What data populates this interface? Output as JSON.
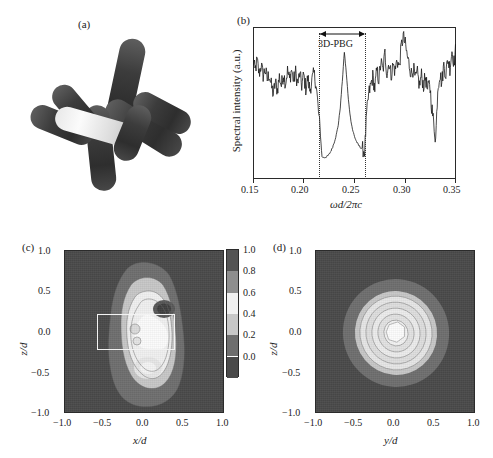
{
  "figure": {
    "panels": [
      {
        "id": "a",
        "label": "(a)",
        "kind": "3d-render",
        "description": "three-dimensional cluster of cylindrical rods"
      },
      {
        "id": "b",
        "label": "(b)",
        "kind": "line"
      },
      {
        "id": "c",
        "label": "(c)",
        "kind": "contour"
      },
      {
        "id": "d",
        "label": "(d)",
        "kind": "contour"
      }
    ]
  },
  "chart_data": [
    {
      "panel": "b",
      "type": "line",
      "title": "",
      "xlabel": "ωd/2πc",
      "ylabel": "Spectral intensity (a.u.)",
      "xlim": [
        0.15,
        0.35
      ],
      "ylim": [
        0,
        1
      ],
      "xticks": [
        0.15,
        0.2,
        0.25,
        0.3,
        0.35
      ],
      "xticklabels": [
        "0.15",
        "0.20",
        "0.25",
        "0.30",
        "0.35"
      ],
      "yticks": [],
      "yticklabels": [],
      "grid": false,
      "legend": null,
      "annotations": [
        {
          "text": "3D-PBG",
          "kind": "arrow-span",
          "x_start": 0.215,
          "x_end": 0.26,
          "y": 0.93
        }
      ],
      "guides": [
        {
          "type": "vline",
          "style": "dotted",
          "x": 0.215
        },
        {
          "type": "vline",
          "style": "dotted",
          "x": 0.26
        }
      ],
      "x": [
        0.15,
        0.152,
        0.154,
        0.156,
        0.158,
        0.16,
        0.162,
        0.164,
        0.166,
        0.168,
        0.17,
        0.172,
        0.174,
        0.176,
        0.178,
        0.18,
        0.182,
        0.184,
        0.186,
        0.188,
        0.19,
        0.192,
        0.194,
        0.196,
        0.198,
        0.2,
        0.202,
        0.204,
        0.206,
        0.208,
        0.21,
        0.212,
        0.214,
        0.216,
        0.218,
        0.22,
        0.222,
        0.224,
        0.226,
        0.228,
        0.23,
        0.232,
        0.234,
        0.236,
        0.238,
        0.24,
        0.242,
        0.244,
        0.246,
        0.248,
        0.25,
        0.252,
        0.254,
        0.256,
        0.258,
        0.26,
        0.262,
        0.264,
        0.266,
        0.268,
        0.27,
        0.272,
        0.274,
        0.276,
        0.278,
        0.28,
        0.282,
        0.284,
        0.286,
        0.288,
        0.29,
        0.292,
        0.294,
        0.296,
        0.298,
        0.3,
        0.302,
        0.304,
        0.306,
        0.308,
        0.31,
        0.312,
        0.314,
        0.316,
        0.318,
        0.32,
        0.322,
        0.324,
        0.326,
        0.328,
        0.33,
        0.332,
        0.334,
        0.336,
        0.338,
        0.34,
        0.342,
        0.344,
        0.346,
        0.348,
        0.35
      ],
      "y": [
        0.8,
        0.72,
        0.79,
        0.7,
        0.76,
        0.69,
        0.73,
        0.66,
        0.7,
        0.62,
        0.56,
        0.64,
        0.59,
        0.68,
        0.62,
        0.7,
        0.64,
        0.72,
        0.66,
        0.73,
        0.65,
        0.71,
        0.63,
        0.7,
        0.62,
        0.69,
        0.6,
        0.67,
        0.59,
        0.65,
        0.7,
        0.64,
        0.48,
        0.32,
        0.13,
        0.125,
        0.13,
        0.14,
        0.16,
        0.19,
        0.23,
        0.28,
        0.35,
        0.47,
        0.65,
        0.85,
        0.7,
        0.52,
        0.4,
        0.32,
        0.27,
        0.235,
        0.21,
        0.195,
        0.185,
        0.17,
        0.42,
        0.56,
        0.62,
        0.68,
        0.6,
        0.72,
        0.66,
        0.78,
        0.72,
        0.84,
        0.7,
        0.78,
        0.69,
        0.76,
        0.72,
        0.8,
        0.74,
        0.88,
        0.96,
        0.9,
        0.82,
        0.76,
        0.7,
        0.74,
        0.66,
        0.7,
        0.62,
        0.69,
        0.62,
        0.68,
        0.58,
        0.64,
        0.48,
        0.36,
        0.25,
        0.6,
        0.7,
        0.64,
        0.76,
        0.7,
        0.8,
        0.74,
        0.86,
        0.78,
        0.88
      ]
    },
    {
      "panel": "c",
      "type": "heatmap",
      "title": "",
      "xlabel": "x/d",
      "ylabel": "z/d",
      "xlim": [
        -1.0,
        1.0
      ],
      "ylim": [
        -1.0,
        1.0
      ],
      "xticks": [
        -1.0,
        -0.5,
        0.0,
        0.5,
        1.0
      ],
      "xticklabels": [
        "−1.0",
        "−0.5",
        "0.0",
        "0.5",
        "1.0"
      ],
      "yticks": [
        -1.0,
        -0.5,
        0.0,
        0.5,
        1.0
      ],
      "yticklabels": [
        "−1.0",
        "−0.5",
        "0.0",
        "0.5",
        "1.0"
      ],
      "grid": false,
      "overlay": {
        "type": "rectangle",
        "x0": -0.46,
        "x1": 0.5,
        "y0": -0.22,
        "y1": 0.22,
        "color": "#f2f2f2"
      },
      "zrange": [
        0.0,
        1.0
      ]
    },
    {
      "panel": "d",
      "type": "heatmap",
      "title": "",
      "xlabel": "y/d",
      "ylabel": "z/d",
      "xlim": [
        -1.0,
        1.0
      ],
      "ylim": [
        -1.0,
        1.0
      ],
      "xticks": [
        -1.0,
        -0.5,
        0.0,
        0.5,
        1.0
      ],
      "xticklabels": [
        "−1.0",
        "−0.5",
        "0.0",
        "0.5",
        "1.0"
      ],
      "yticks": [
        -1.0,
        -0.5,
        0.0,
        0.5,
        1.0
      ],
      "yticklabels": [
        "−1.0",
        "−0.5",
        "0.0",
        "0.5",
        "1.0"
      ],
      "grid": false,
      "zrange": [
        0.0,
        1.0
      ]
    }
  ],
  "colorbar": {
    "ticks": [
      1.0,
      0.8,
      0.6,
      0.4,
      0.2,
      0.0
    ],
    "ticklabels": [
      "1.0",
      "0.8",
      "0.6",
      "0.4",
      "0.2",
      "0.0"
    ],
    "levels": [
      {
        "value": 1.0,
        "color": "#545454"
      },
      {
        "value": 0.8,
        "color": "#8e8e8e"
      },
      {
        "value": 0.6,
        "color": "#f0f0f0"
      },
      {
        "value": 0.4,
        "color": "#c7c7c7"
      },
      {
        "value": 0.2,
        "color": "#6e6e6e"
      },
      {
        "value": 0.0,
        "color": "#4a4a4a"
      }
    ]
  },
  "labels": {
    "panel_a": "(a)",
    "panel_b": "(b)",
    "panel_c": "(c)",
    "panel_d": "(d)",
    "pbg": "3D-PBG",
    "spectral_axis": "Spectral intensity (a.u.)",
    "omega_axis": "ωd/2πc",
    "xd": "x/d",
    "yd": "y/d",
    "zd": "z/d",
    "t_m10": "−1.0",
    "t_m05": "−0.5",
    "t_00": "0.0",
    "t_05": "0.5",
    "t_10": "1.0",
    "w015": "0.15",
    "w020": "0.20",
    "w025": "0.25",
    "w030": "0.30",
    "w035": "0.35",
    "c00": "0.0",
    "c02": "0.2",
    "c04": "0.4",
    "c06": "0.6",
    "c08": "0.8",
    "c10": "1.0"
  }
}
